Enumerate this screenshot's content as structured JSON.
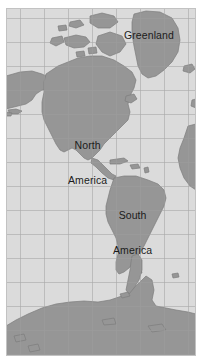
{
  "map": {
    "type": "world-map-western-hemisphere",
    "projection": "mercator",
    "background_color": "#d9d9d9",
    "ocean_color": "#d9d9d9",
    "land_color": "#969696",
    "land_stroke_color": "#7d7d7d",
    "graticule_color": "#a9a9a9",
    "frame_color": "#bdbdbd",
    "grid": {
      "visible": true,
      "vertical_line_count": 8,
      "horizontal_line_count": 14,
      "spacing_px": 24
    },
    "labels": [
      {
        "id": "greenland",
        "text": "Greenland"
      },
      {
        "id": "north_america",
        "line1": "North",
        "line2": "America"
      },
      {
        "id": "south_america",
        "line1": "South",
        "line2": "America"
      }
    ],
    "regions_depicted": [
      "Greenland",
      "Iceland",
      "Canadian Arctic Archipelago",
      "Alaska",
      "North America",
      "Central America",
      "Caribbean",
      "South America",
      "West Africa",
      "Antarctica"
    ]
  }
}
